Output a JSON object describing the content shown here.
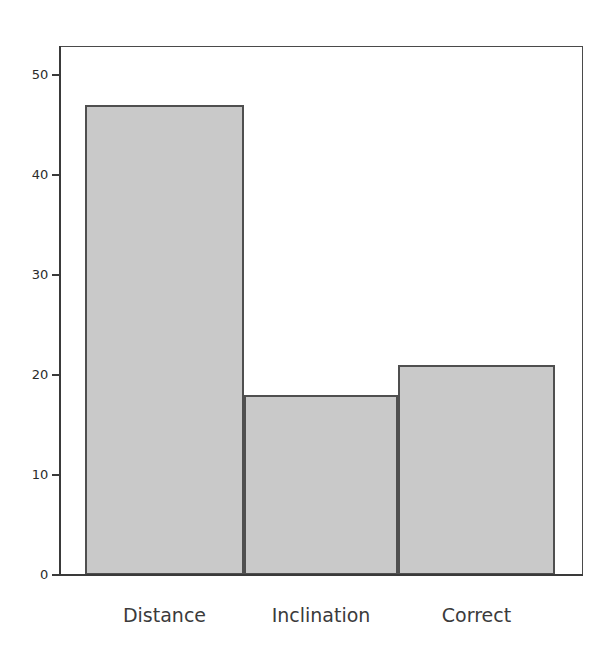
{
  "chart_data": {
    "type": "bar",
    "title": "",
    "subtitle": "",
    "xlabel": "",
    "ylabel": "",
    "categories": [
      "Distance",
      "Inclination",
      "Correct"
    ],
    "values": [
      47,
      18,
      21
    ],
    "series": [
      {
        "name": "",
        "values": [
          47,
          18,
          21
        ]
      }
    ],
    "ylim": [
      0,
      52.9
    ],
    "xlim": [
      0,
      3
    ],
    "y_ticks": [
      0,
      10,
      20,
      30,
      40,
      50
    ],
    "y_tick_labels": [
      "0",
      "10",
      "20",
      "30",
      "40",
      "50"
    ],
    "x_tick_labels": [
      "Distance",
      "Inclination",
      "Correct"
    ],
    "grid": false,
    "legend": false,
    "legend_position": "none",
    "annotations": [],
    "style": {
      "bar_fill": "#c9c9c9",
      "bar_edge": "#4f4f4f",
      "axis_color": "#3a3a3a",
      "frame_color": "#4a4a4a",
      "background": "#ffffff",
      "tick_label_color": "#2b2b2b",
      "category_label_color": "#3b3b3b"
    }
  }
}
